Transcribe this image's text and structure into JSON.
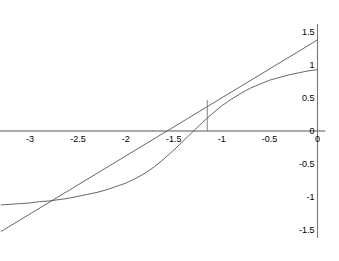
{
  "chart_data": {
    "type": "line",
    "title": "",
    "subtitle": "",
    "xlabel": "",
    "ylabel": "",
    "xlim": [
      -3.32,
      0.08
    ],
    "ylim": [
      -1.62,
      1.62
    ],
    "grid": false,
    "legend": null,
    "axis_position": {
      "x_axis_at_y": 0,
      "y_axis_at_x": 0
    },
    "xticks": [
      -3,
      -2.5,
      -2,
      -1.5,
      -1,
      -0.5,
      0
    ],
    "xtick_labels": [
      "-3",
      "-2.5",
      "-2",
      "-1.5",
      "-1",
      "-0.5",
      "0"
    ],
    "yticks": [
      1.5,
      1,
      0.5,
      0,
      -0.5,
      -1,
      -1.5
    ],
    "ytick_labels": [
      "1.5",
      "1",
      "0.5",
      "0",
      "-0.5",
      "-1",
      "-1.5"
    ],
    "series": [
      {
        "name": "curve",
        "kind": "line",
        "color": "#555555",
        "width": 0.9,
        "points": [
          [
            -3.3,
            -1.12
          ],
          [
            -3.2,
            -1.11
          ],
          [
            -3.1,
            -1.1
          ],
          [
            -3.0,
            -1.09
          ],
          [
            -2.9,
            -1.07
          ],
          [
            -2.8,
            -1.06
          ],
          [
            -2.7,
            -1.04
          ],
          [
            -2.6,
            -1.02
          ],
          [
            -2.5,
            -0.99
          ],
          [
            -2.4,
            -0.96
          ],
          [
            -2.3,
            -0.93
          ],
          [
            -2.2,
            -0.89
          ],
          [
            -2.1,
            -0.84
          ],
          [
            -2.0,
            -0.79
          ],
          [
            -1.9,
            -0.72
          ],
          [
            -1.8,
            -0.64
          ],
          [
            -1.7,
            -0.54
          ],
          [
            -1.6,
            -0.42
          ],
          [
            -1.5,
            -0.29
          ],
          [
            -1.4,
            -0.15
          ],
          [
            -1.3,
            -0.01
          ],
          [
            -1.2,
            0.13
          ],
          [
            -1.14,
            0.21
          ],
          [
            -1.1,
            0.26
          ],
          [
            -1.0,
            0.38
          ],
          [
            -0.9,
            0.48
          ],
          [
            -0.8,
            0.57
          ],
          [
            -0.7,
            0.65
          ],
          [
            -0.6,
            0.71
          ],
          [
            -0.5,
            0.77
          ],
          [
            -0.4,
            0.81
          ],
          [
            -0.3,
            0.85
          ],
          [
            -0.2,
            0.88
          ],
          [
            -0.1,
            0.91
          ],
          [
            0.0,
            0.93
          ]
        ]
      },
      {
        "name": "tangent-line",
        "kind": "line",
        "color": "#555555",
        "width": 0.9,
        "points": [
          [
            -3.3,
            -1.52
          ],
          [
            0.0,
            1.38
          ]
        ]
      }
    ],
    "annotations": [
      {
        "name": "tangent-point-dropline",
        "kind": "vertical-segment",
        "x": -1.15,
        "y_from": 0.0,
        "y_to": 0.47,
        "color": "#777777",
        "width": 0.9
      }
    ]
  },
  "axes": {
    "x_axis_color": "#555555",
    "y_axis_color": "#777777",
    "axis_width": 1.1
  },
  "colors": {
    "background": "#ffffff",
    "ink": "#000000",
    "curve": "#555555",
    "axis": "#666666"
  }
}
